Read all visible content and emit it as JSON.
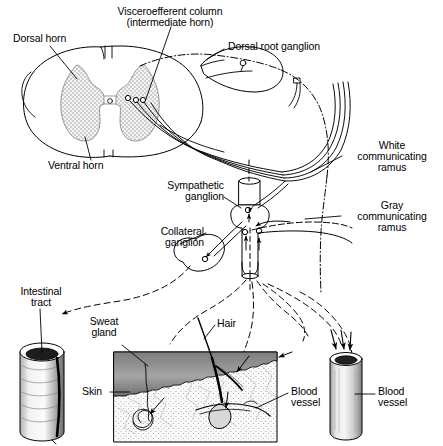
{
  "figure": {
    "background_color": "#ffffff",
    "ink_color": "#000000",
    "gray_matter_color": "#9a9a9a",
    "width": 443,
    "height": 446
  },
  "labels": {
    "dorsal_horn": "Dorsal horn",
    "visceroefferent_column_line1": "Visceroefferent column",
    "visceroefferent_column_line2": "(intermediate horn)",
    "dorsal_root_ganglion": "Dorsal root ganglion",
    "ventral_horn": "Ventral horn",
    "sympathetic_ganglion_line1": "Sympathetic",
    "sympathetic_ganglion_line2": "ganglion",
    "collateral_ganglion_line1": "Collateral",
    "collateral_ganglion_line2": "ganglion",
    "white_ramus_line1": "White",
    "white_ramus_line2": "communicating",
    "white_ramus_line3": "ramus",
    "gray_ramus_line1": "Gray",
    "gray_ramus_line2": "communicating",
    "gray_ramus_line3": "ramus",
    "intestinal_tract_line1": "Intestinal",
    "intestinal_tract_line2": "tract",
    "sweat_gland_line1": "Sweat",
    "sweat_gland_line2": "gland",
    "hair": "Hair",
    "skin": "Skin",
    "blood_vessel_skin_line1": "Blood",
    "blood_vessel_skin_line2": "vessel",
    "blood_vessel_free_line1": "Blood",
    "blood_vessel_free_line2": "vessel"
  },
  "structures": {
    "spinal_cord": "spinal-cord-cross-section",
    "gray_matter": "butterfly-gray-matter",
    "dorsal_root_ganglion": "dorsal-root-ganglion-oval",
    "spinal_nerve": "spinal-nerve-trunk",
    "sympathetic_chain": "sympathetic-chain-ganglion",
    "collateral_ganglion": "collateral-ganglion",
    "white_ramus": "white-communicating-ramus",
    "gray_ramus": "gray-communicating-ramus",
    "intestine": "intestinal-tract-cylinder",
    "skin_block": "skin-block-cutaway",
    "sweat_gland": "coiled-sweat-gland",
    "hair_follicle": "hair-follicle",
    "dermal_vessel": "dermal-blood-vessel",
    "blood_vessel": "blood-vessel-cylinder"
  }
}
